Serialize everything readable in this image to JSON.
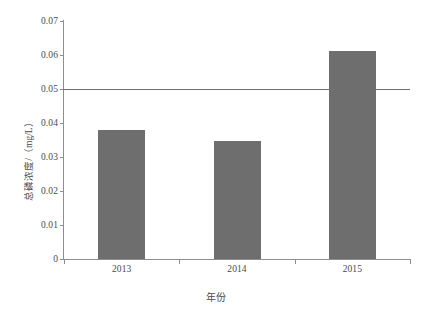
{
  "chart_data": {
    "type": "bar",
    "title": "",
    "categories": [
      "2013",
      "2014",
      "2015"
    ],
    "values": [
      0.038,
      0.0347,
      0.0612
    ],
    "series": [
      {
        "name": "总磷浓度",
        "values": [
          0.038,
          0.0347,
          0.0612
        ]
      }
    ],
    "xlabel": "年份",
    "ylabel": "总磷浓度/（mg/L）",
    "ylim": [
      0,
      0.07
    ],
    "ytick_labels": [
      "0",
      "0.01",
      "0.02",
      "0.03",
      "0.04",
      "0.05",
      "0.06",
      "0.07"
    ],
    "ytick_values": [
      0,
      0.01,
      0.02,
      0.03,
      0.04,
      0.05,
      0.06,
      0.07
    ],
    "xtick_labels": [
      "2013",
      "2014",
      "2015"
    ],
    "grid": false,
    "legend": false,
    "annotations": [
      {
        "name": "reference-line",
        "kind": "horizontal-line",
        "value": 0.05,
        "label": ""
      }
    ],
    "colors": {
      "bar": "#6e6e6e",
      "axis": "#8e8e8e",
      "reference_line": "#6f6f6f",
      "text": "#4a4a4a",
      "background": "#ffffff"
    }
  }
}
